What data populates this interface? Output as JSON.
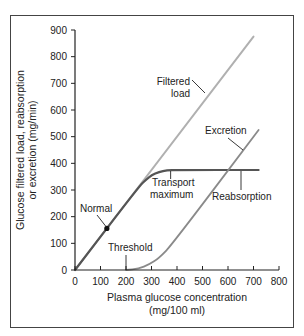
{
  "chart_data": {
    "type": "line",
    "title": "",
    "xlabel": "Plasma glucose concentration",
    "xlabel_units": "(mg/100 ml)",
    "ylabel": "Glucose filtered load, reabsorption",
    "ylabel_line2": "or excretion (mg/min)",
    "xlim": [
      0,
      800
    ],
    "ylim": [
      0,
      900
    ],
    "xticks": [
      0,
      100,
      200,
      300,
      400,
      500,
      600,
      700,
      800
    ],
    "yticks": [
      0,
      100,
      200,
      300,
      400,
      500,
      600,
      700,
      800,
      900
    ],
    "grid": false,
    "series": [
      {
        "name": "Filtered load",
        "color": "#b0b0b0",
        "x": [
          0,
          700
        ],
        "y": [
          0,
          875
        ]
      },
      {
        "name": "Reabsorption",
        "color": "#555555",
        "x": [
          0,
          250,
          280,
          300,
          330,
          360,
          400,
          720
        ],
        "y": [
          0,
          312,
          340,
          355,
          368,
          374,
          375,
          375
        ]
      },
      {
        "name": "Excretion",
        "color": "#8a8a8a",
        "x": [
          200,
          250,
          290,
          330,
          380,
          720
        ],
        "y": [
          0,
          5,
          20,
          45,
          95,
          525
        ]
      }
    ],
    "annotations": [
      {
        "text": "Filtered",
        "text2": "load",
        "target": "Filtered load"
      },
      {
        "text": "Excretion",
        "target": "Excretion"
      },
      {
        "text": "Transport",
        "text2": "maximum",
        "x": 375,
        "y": 375
      },
      {
        "text": "Reabsorption",
        "target": "Reabsorption"
      },
      {
        "text": "Normal",
        "x": 125,
        "y": 156
      },
      {
        "text": "Threshold",
        "x": 200,
        "y": 0
      }
    ],
    "normal_point": {
      "x": 125,
      "y": 156
    }
  }
}
